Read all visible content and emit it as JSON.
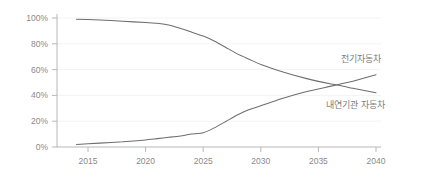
{
  "chart_data": {
    "type": "line",
    "title": "",
    "subtitle": "",
    "xlabel": "",
    "ylabel": "",
    "xlim": [
      2014,
      2040
    ],
    "ylim": [
      0,
      100
    ],
    "grid": true,
    "legend_position": "inline-right",
    "x_ticks": [
      "2015",
      "2020",
      "2025",
      "2030",
      "2035",
      "2040"
    ],
    "x_tick_values": [
      2015,
      2020,
      2025,
      2030,
      2035,
      2040
    ],
    "y_ticks": [
      "0%",
      "20%",
      "40%",
      "60%",
      "80%",
      "100%"
    ],
    "y_tick_values": [
      0,
      20,
      40,
      60,
      80,
      100
    ],
    "x": [
      2014,
      2016,
      2018,
      2020,
      2021,
      2022,
      2023,
      2024,
      2025,
      2026,
      2027,
      2028,
      2029,
      2030,
      2032,
      2034,
      2036,
      2037,
      2038,
      2040
    ],
    "series": [
      {
        "name": "내연기관 자동차",
        "color": "#6e6e6e",
        "values": [
          99,
          98.5,
          97.5,
          96.5,
          96,
          94.5,
          92,
          89,
          86,
          82,
          77,
          72,
          68,
          64,
          58,
          53,
          49,
          47.5,
          45.5,
          42
        ]
      },
      {
        "name": "전기자동차",
        "color": "#6e6e6e",
        "values": [
          2,
          3,
          4,
          5.5,
          6.5,
          7.5,
          8.5,
          10,
          11,
          15,
          20,
          25,
          29,
          32,
          38,
          43,
          47,
          49,
          51,
          56
        ]
      }
    ],
    "annotations": [
      {
        "name": "ev-series-label",
        "text": "전기자동차",
        "x_px": 341,
        "y_px": 62
      },
      {
        "name": "ice-series-label",
        "text": "내연기관 자동차",
        "x_px": 326,
        "y_px": 108
      }
    ]
  },
  "axis": {
    "y_label_0": "0%",
    "y_label_20": "20%",
    "y_label_40": "40%",
    "y_label_60": "60%",
    "y_label_80": "80%",
    "y_label_100": "100%",
    "x_label_2015": "2015",
    "x_label_2020": "2020",
    "x_label_2025": "2025",
    "x_label_2030": "2030",
    "x_label_2035": "2035",
    "x_label_2040": "2040"
  },
  "colors": {
    "background": "#ffffff",
    "line": "#6e6e6e",
    "grid": "#f0f0f0",
    "axis": "#b0b0b0",
    "text": "#8a8a8a"
  }
}
